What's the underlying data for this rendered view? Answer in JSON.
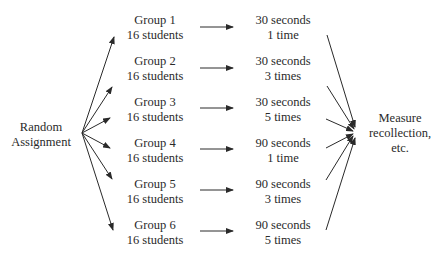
{
  "source": {
    "line1": "Random",
    "line2": "Assignment"
  },
  "groups": [
    {
      "name": "Group 1",
      "size": "16 students",
      "duration": "30 seconds",
      "repetitions": "1 time"
    },
    {
      "name": "Group 2",
      "size": "16 students",
      "duration": "30 seconds",
      "repetitions": "3 times"
    },
    {
      "name": "Group 3",
      "size": "16 students",
      "duration": "30 seconds",
      "repetitions": "5 times"
    },
    {
      "name": "Group 4",
      "size": "16 students",
      "duration": "90 seconds",
      "repetitions": "1 time"
    },
    {
      "name": "Group 5",
      "size": "16 students",
      "duration": "90 seconds",
      "repetitions": "3 times"
    },
    {
      "name": "Group 6",
      "size": "16 students",
      "duration": "90 seconds",
      "repetitions": "5 times"
    }
  ],
  "outcome": {
    "line1": "Measure",
    "line2": "recollection,",
    "line3": "etc."
  },
  "colors": {
    "line": "#2a2a2a",
    "background": "#ffffff"
  }
}
